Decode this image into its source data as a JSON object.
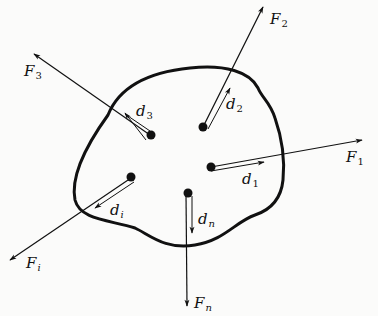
{
  "diagram": {
    "forces": [
      {
        "id": "F1",
        "symbol": "F",
        "subscript": "1"
      },
      {
        "id": "F2",
        "symbol": "F",
        "subscript": "2"
      },
      {
        "id": "F3",
        "symbol": "F",
        "subscript": "3"
      },
      {
        "id": "Fi",
        "symbol": "F",
        "subscript": "i"
      },
      {
        "id": "Fn",
        "symbol": "F",
        "subscript": "n"
      }
    ],
    "displacements": [
      {
        "id": "d1",
        "symbol": "d",
        "subscript": "1"
      },
      {
        "id": "d2",
        "symbol": "d",
        "subscript": "2"
      },
      {
        "id": "d3",
        "symbol": "d",
        "subscript": "3"
      },
      {
        "id": "di",
        "symbol": "d",
        "subscript": "i"
      },
      {
        "id": "dn",
        "symbol": "d",
        "subscript": "n"
      }
    ],
    "colors": {
      "ink": "#111111",
      "background": "#fbfbfa"
    }
  }
}
